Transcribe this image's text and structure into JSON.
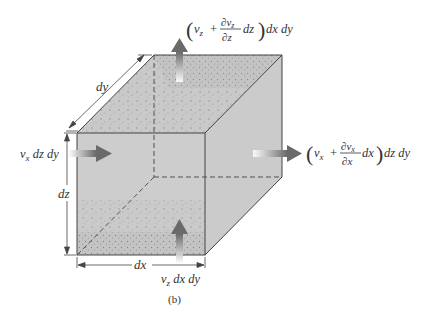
{
  "figure": {
    "caption": "(b)",
    "colors": {
      "face_fill": "#c8c8c8",
      "edge": "#444444",
      "arrow": "#6e6e6e"
    },
    "dimensions": {
      "dx": "dx",
      "dy": "dy",
      "dz": "dz"
    },
    "flows": {
      "inflow_x": {
        "v": "v",
        "sub": "x",
        "rest": " dz dy"
      },
      "inflow_z": {
        "v": "v",
        "sub": "z",
        "rest": " dx dy"
      },
      "outflow_x": {
        "v": "v",
        "sub": "x",
        "plus": "+",
        "num": "∂v",
        "num_sub": "x",
        "den": "∂x",
        "d": "dx",
        "rest": "dz dy"
      },
      "outflow_z": {
        "v": "v",
        "sub": "z",
        "plus": "+",
        "num": "∂v",
        "num_sub": "z",
        "den": "∂z",
        "d": "dz",
        "rest": "dx dy"
      }
    }
  }
}
